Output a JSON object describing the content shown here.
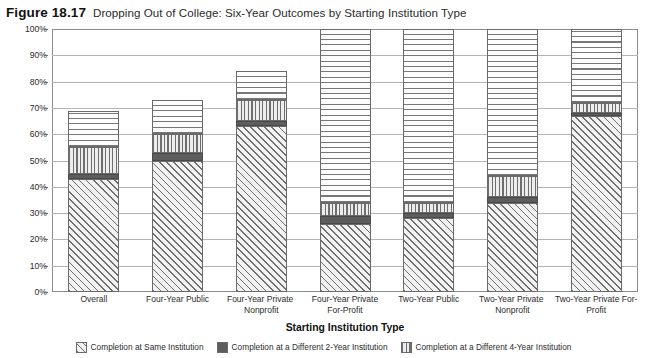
{
  "figure": {
    "number": "Figure 18.17",
    "title": "Dropping Out of College: Six-Year Outcomes by Starting Institution Type"
  },
  "axes": {
    "ylabel": "Six-Year Outcomes",
    "xlabel": "Starting Institution Type",
    "yticks": [
      "0%",
      "10%",
      "20%",
      "30%",
      "40%",
      "50%",
      "60%",
      "70%",
      "80%",
      "90%",
      "100%"
    ]
  },
  "legend": {
    "items": [
      {
        "label": "Completion at Same Institution",
        "pattern": "diagonal-hatch",
        "color": "#6e6e6e"
      },
      {
        "label": "Completion at a Different 2-Year Institution",
        "pattern": "solid-gray",
        "color": "#5d5d5d"
      },
      {
        "label": "Completion at a Different 4-Year Institution",
        "pattern": "vertical-lines",
        "color": "#6e6e6e"
      }
    ]
  },
  "chart_data": {
    "type": "bar",
    "title": "Dropping Out of College: Six-Year Outcomes by Starting Institution Type",
    "xlabel": "Starting Institution Type",
    "ylabel": "Six-Year Outcomes",
    "ylim": [
      0,
      100
    ],
    "stacked": true,
    "grid": true,
    "legend_position": "bottom",
    "categories": [
      "Overall",
      "Four-Year Public",
      "Four-Year Private Nonprofit",
      "Four-Year Private For-Profit",
      "Two-Year Public",
      "Two-Year Private Nonprofit",
      "Two-Year Private For-Profit"
    ],
    "series": [
      {
        "name": "Completion at Same Institution",
        "values": [
          43,
          50,
          63,
          26,
          28,
          34,
          67
        ]
      },
      {
        "name": "Completion at a Different 2-Year Institution",
        "values": [
          2,
          3,
          2,
          3,
          2,
          2,
          1
        ]
      },
      {
        "name": "Completion at a Different 4-Year Institution",
        "values": [
          10,
          7,
          8,
          5,
          4,
          8,
          4
        ]
      },
      {
        "name": "Not Completed",
        "values": [
          14,
          13,
          11,
          66,
          66,
          56,
          28
        ]
      }
    ],
    "cumulative_tops": [
      [
        43,
        45,
        55,
        69
      ],
      [
        50,
        53,
        60,
        73
      ],
      [
        63,
        65,
        73,
        84
      ],
      [
        26,
        29,
        34,
        100
      ],
      [
        28,
        30,
        34,
        100
      ],
      [
        34,
        36,
        44,
        100
      ],
      [
        67,
        68,
        72,
        100
      ]
    ]
  }
}
